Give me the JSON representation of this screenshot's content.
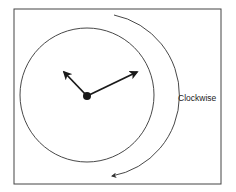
{
  "diagram": {
    "rotation_label": "Clockwise",
    "colors": {
      "stroke": "#333333",
      "hands": "#1a1a1a",
      "frame": "#444444",
      "background": "#ffffff"
    },
    "elements": {
      "frame": "frame",
      "clock_face": "circle",
      "hour_hand": "arrow pointing toward ~10 o'clock",
      "minute_hand": "arrow pointing toward ~2 o'clock",
      "center_pivot": "filled dot",
      "rotation_arrow": "curved arrow, clockwise"
    }
  }
}
